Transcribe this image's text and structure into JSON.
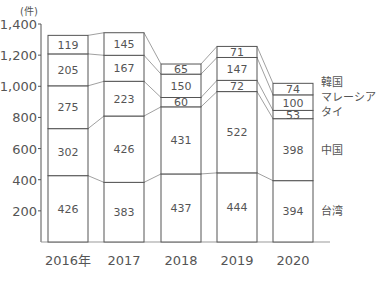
{
  "chart_data": {
    "type": "bar",
    "stacked": true,
    "title": "",
    "unit_label": "(件)",
    "xlabel": "",
    "ylabel": "(件)",
    "ylim": [
      0,
      1400
    ],
    "yticks": [
      200,
      400,
      600,
      800,
      1000,
      1200,
      1400
    ],
    "ytick_labels": [
      "200",
      "400",
      "600",
      "800",
      "1,000",
      "1,200",
      "1,400"
    ],
    "categories": [
      "2016年",
      "2017",
      "2018",
      "2019",
      "2020"
    ],
    "grid": false,
    "legend_position": "right-inline",
    "series": [
      {
        "name": "台湾",
        "values": [
          426,
          383,
          437,
          444,
          394
        ]
      },
      {
        "name": "中国",
        "values": [
          302,
          426,
          431,
          522,
          398
        ]
      },
      {
        "name": "タイ",
        "values": [
          275,
          223,
          60,
          72,
          53
        ]
      },
      {
        "name": "マレーシア",
        "values": [
          205,
          167,
          150,
          147,
          100
        ]
      },
      {
        "name": "韓国",
        "values": [
          119,
          145,
          65,
          71,
          74
        ]
      }
    ]
  },
  "colors": {
    "line": "#555555",
    "text": "#555555",
    "bar_fill": "#ffffff"
  }
}
